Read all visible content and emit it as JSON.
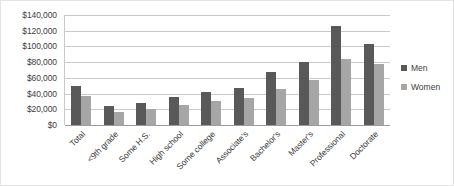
{
  "chart_data": {
    "type": "bar",
    "title": "",
    "subtitle": "",
    "xlabel": "",
    "ylabel": "",
    "ylim": [
      0,
      140000
    ],
    "ytick_step": 20000,
    "ytick_labels": [
      "$140,000",
      "$120,000",
      "$100,000",
      "$80,000",
      "$60,000",
      "$40,000",
      "$20,000",
      "$0"
    ],
    "grid": true,
    "legend_position": "right",
    "categories": [
      "Total",
      "<9th grade",
      "Some H.S.",
      "High school",
      "Some college",
      "Associate's",
      "Bachelor's",
      "Master's",
      "Professional",
      "Doctorate"
    ],
    "series": [
      {
        "name": "Men",
        "color": "#595959",
        "values": [
          50000,
          24000,
          28000,
          36000,
          42000,
          47000,
          68000,
          80000,
          126000,
          103000
        ]
      },
      {
        "name": "Women",
        "color": "#a6a6a6",
        "values": [
          37000,
          17000,
          20000,
          26000,
          30000,
          34000,
          46000,
          57000,
          84000,
          78000
        ]
      }
    ]
  },
  "colors": {
    "men": "#595959",
    "women": "#a6a6a6",
    "gridline": "#c9c9c9",
    "axis": "#9c9c9c",
    "text": "#3d3d3d",
    "border": "#e3e3e3",
    "background": "#ffffff"
  }
}
